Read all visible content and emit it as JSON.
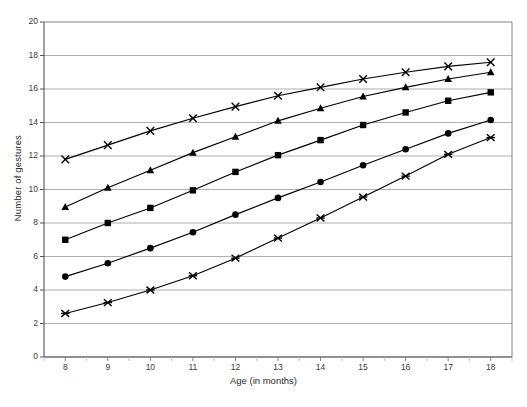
{
  "figure": {
    "ylabel": "Number of gestures",
    "xlabel": "Age (in months)",
    "caption": ""
  },
  "axis": {
    "y_ticks": [
      "0",
      "2",
      "4",
      "6",
      "8",
      "10",
      "12",
      "14",
      "16",
      "18",
      "20"
    ],
    "x_ticks": [
      "8",
      "9",
      "10",
      "11",
      "12",
      "13",
      "14",
      "15",
      "16",
      "17",
      "18"
    ]
  },
  "colors": {
    "ink": "#000000",
    "grid": "#9a9a9a",
    "axis": "#6a6a6a",
    "background": "#ffffff"
  },
  "chart_data": {
    "type": "line",
    "title": "",
    "xlabel": "Age (in months)",
    "ylabel": "Number of gestures",
    "xlim": [
      7.5,
      18.5
    ],
    "ylim": [
      0,
      20
    ],
    "ytick_step": 2,
    "grid": true,
    "legend": "none",
    "x": [
      8,
      9,
      10,
      11,
      12,
      13,
      14,
      15,
      16,
      17,
      18
    ],
    "series": [
      {
        "name": "Series 1",
        "marker": "cross-x",
        "values": [
          11.8,
          12.65,
          13.5,
          14.25,
          14.95,
          15.6,
          16.1,
          16.6,
          17.0,
          17.35,
          17.6
        ]
      },
      {
        "name": "Series 2",
        "marker": "triangle",
        "values": [
          8.95,
          10.1,
          11.15,
          12.2,
          13.15,
          14.1,
          14.85,
          15.55,
          16.1,
          16.6,
          17.0
        ]
      },
      {
        "name": "Series 3",
        "marker": "square",
        "values": [
          7.0,
          8.0,
          8.9,
          9.95,
          11.05,
          12.05,
          12.95,
          13.85,
          14.6,
          15.3,
          15.8
        ]
      },
      {
        "name": "Series 4",
        "marker": "circle",
        "values": [
          4.8,
          5.6,
          6.5,
          7.45,
          8.5,
          9.5,
          10.45,
          11.45,
          12.4,
          13.35,
          14.15
        ]
      },
      {
        "name": "Series 5",
        "marker": "asterisk",
        "values": [
          2.6,
          3.25,
          4.0,
          4.85,
          5.9,
          7.1,
          8.3,
          9.55,
          10.8,
          12.1,
          13.1
        ]
      }
    ]
  }
}
